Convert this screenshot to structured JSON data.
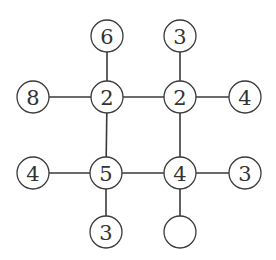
{
  "diagram": {
    "type": "number-graph-puzzle",
    "node_radius": 16,
    "nodes": [
      {
        "id": "n-top-left",
        "label": "6",
        "x": 107,
        "y": 36
      },
      {
        "id": "n-top-right",
        "label": "3",
        "x": 180,
        "y": 36
      },
      {
        "id": "n-left-upper",
        "label": "8",
        "x": 33,
        "y": 97
      },
      {
        "id": "n-center-ul",
        "label": "2",
        "x": 107,
        "y": 97
      },
      {
        "id": "n-center-ur",
        "label": "2",
        "x": 180,
        "y": 97
      },
      {
        "id": "n-right-upper",
        "label": "4",
        "x": 245,
        "y": 97
      },
      {
        "id": "n-left-lower",
        "label": "4",
        "x": 33,
        "y": 173
      },
      {
        "id": "n-center-ll",
        "label": "5",
        "x": 106,
        "y": 173
      },
      {
        "id": "n-center-lr",
        "label": "4",
        "x": 180,
        "y": 173
      },
      {
        "id": "n-right-lower",
        "label": "3",
        "x": 245,
        "y": 173
      },
      {
        "id": "n-bottom-left",
        "label": "3",
        "x": 106,
        "y": 232
      },
      {
        "id": "n-bottom-right",
        "label": "",
        "x": 180,
        "y": 232
      }
    ],
    "edges": [
      [
        "n-top-left",
        "n-center-ul"
      ],
      [
        "n-top-right",
        "n-center-ur"
      ],
      [
        "n-left-upper",
        "n-center-ul"
      ],
      [
        "n-center-ul",
        "n-center-ur"
      ],
      [
        "n-center-ur",
        "n-right-upper"
      ],
      [
        "n-center-ul",
        "n-center-ll"
      ],
      [
        "n-center-ur",
        "n-center-lr"
      ],
      [
        "n-left-lower",
        "n-center-ll"
      ],
      [
        "n-center-ll",
        "n-center-lr"
      ],
      [
        "n-center-lr",
        "n-right-lower"
      ],
      [
        "n-center-ll",
        "n-bottom-left"
      ],
      [
        "n-center-lr",
        "n-bottom-right"
      ]
    ],
    "colors": {
      "stroke": "#3a3a3a",
      "text": "#333333",
      "fill": "#ffffff"
    }
  }
}
